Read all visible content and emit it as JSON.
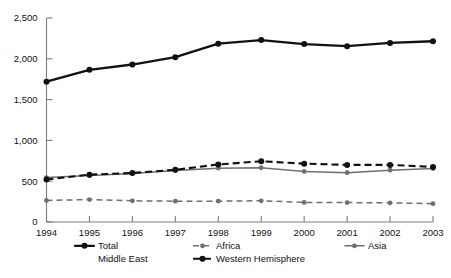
{
  "chart_data": {
    "type": "line",
    "title": "",
    "xlabel": "",
    "ylabel": "",
    "categories": [
      "1994",
      "1995",
      "1996",
      "1997",
      "1998",
      "1999",
      "2000",
      "2001",
      "2002",
      "2003"
    ],
    "x": [
      1994,
      1995,
      1996,
      1997,
      1998,
      1999,
      2000,
      2001,
      2002,
      2003
    ],
    "ylim": [
      0,
      2500
    ],
    "xlim": [
      1994,
      2003
    ],
    "yticks": [
      0,
      500,
      1000,
      1500,
      2000,
      2500
    ],
    "ytick_labels": [
      "0",
      "500",
      "1,000",
      "1,500",
      "2,000",
      "2,500"
    ],
    "xtick_labels": [
      "1994",
      "1995",
      "1996",
      "1997",
      "1998",
      "1999",
      "2000",
      "2001",
      "2002",
      "2003"
    ],
    "grid": false,
    "legend_position": "bottom",
    "series": [
      {
        "name": "Total Middle East",
        "style": "solid-bold-black",
        "color": "#111111",
        "values": [
          1720,
          1865,
          1930,
          2020,
          2185,
          2230,
          2180,
          2155,
          2195,
          2215
        ]
      },
      {
        "name": "Western Hemisphere",
        "style": "dashed-bold-black",
        "color": "#111111",
        "values": [
          520,
          580,
          600,
          640,
          705,
          745,
          715,
          700,
          700,
          675
        ]
      },
      {
        "name": "Asia",
        "style": "solid-gray",
        "color": "#6e6e6e",
        "values": [
          545,
          570,
          595,
          630,
          660,
          665,
          620,
          605,
          635,
          655
        ]
      },
      {
        "name": "Africa",
        "style": "dashed-gray",
        "color": "#6e6e6e",
        "values": [
          265,
          275,
          260,
          255,
          255,
          260,
          240,
          238,
          235,
          225
        ]
      }
    ]
  },
  "legend": {
    "entries": [
      {
        "label": "Total",
        "marker": "solid-bold-black"
      },
      {
        "label": "Africa",
        "marker": "dashed-gray"
      },
      {
        "label": "Asia",
        "marker": "solid-gray"
      },
      {
        "label": "Middle East",
        "marker": "none"
      },
      {
        "label": "Western Hemisphere",
        "marker": "dashed-bold-black"
      }
    ]
  },
  "axis": {
    "y_labels": [
      "2,500",
      "2,000",
      "1,500",
      "1,000",
      "500",
      "0"
    ],
    "x_labels": [
      "1994",
      "1995",
      "1996",
      "1997",
      "1998",
      "1999",
      "2000",
      "2001",
      "2002",
      "2003"
    ]
  },
  "colors": {
    "ink": "#111111",
    "gray": "#6e6e6e",
    "axis": "#7c7c7c",
    "background": "#ffffff"
  }
}
